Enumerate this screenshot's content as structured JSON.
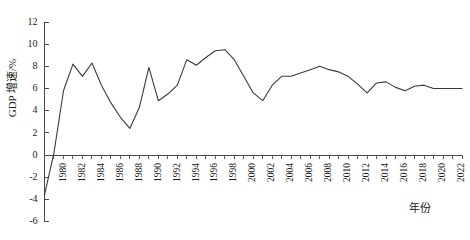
{
  "chart_data": {
    "type": "line",
    "title": "",
    "xlabel": "年份",
    "ylabel": "GDP 增速/%",
    "xlim": [
      1978,
      2022
    ],
    "ylim": [
      -6,
      12
    ],
    "grid": false,
    "legend": null,
    "y_ticks": [
      12,
      10,
      8,
      6,
      4,
      2,
      0,
      -2,
      -4,
      -6
    ],
    "y_tick_labels": [
      "12",
      "10",
      "8",
      "6",
      "4",
      "2",
      "0",
      "-2",
      "-4",
      "-6"
    ],
    "x_ticks": [
      1980,
      1982,
      1984,
      1986,
      1988,
      1990,
      1992,
      1994,
      1996,
      1998,
      2000,
      2002,
      2004,
      2006,
      2008,
      2010,
      2012,
      2014,
      2016,
      2018,
      2020,
      2022
    ],
    "x_tick_labels": [
      "1980",
      "1982",
      "1984",
      "1986",
      "1988",
      "1990",
      "1992",
      "1994",
      "1996",
      "1998",
      "2000",
      "2002",
      "2004",
      "2006",
      "2008",
      "2010",
      "2012",
      "2014",
      "2016",
      "2018",
      "2020",
      "2022"
    ],
    "x": [
      1978,
      1979,
      1980,
      1981,
      1982,
      1983,
      1984,
      1985,
      1986,
      1987,
      1988,
      1989,
      1990,
      1991,
      1992,
      1993,
      1994,
      1995,
      1996,
      1997,
      1998,
      1999,
      2000,
      2001,
      2002,
      2003,
      2004,
      2005,
      2006,
      2007,
      2008,
      2009,
      2010,
      2011,
      2012,
      2013,
      2014,
      2015,
      2016,
      2017,
      2018,
      2019,
      2020,
      2021,
      2022
    ],
    "values": [
      -3.6,
      0.2,
      5.8,
      8.2,
      7.1,
      8.3,
      6.3,
      4.7,
      3.4,
      2.4,
      4.3,
      7.9,
      4.9,
      5.5,
      6.3,
      8.6,
      8.1,
      8.8,
      9.4,
      9.5,
      8.6,
      7.1,
      5.6,
      4.9,
      6.3,
      7.1,
      7.1,
      7.4,
      7.7,
      8.0,
      7.7,
      7.5,
      7.1,
      6.4,
      5.6,
      6.5,
      6.6,
      6.1,
      5.8,
      6.2,
      6.3,
      6.0,
      6.0,
      6.0,
      6.0
    ],
    "series_name": "GDP 增速"
  },
  "axis": {
    "y_title": "GDP 增速/%",
    "x_title": "年份"
  },
  "colors": {
    "line": "#3a3a3a",
    "axis": "#4a4a4a",
    "background": "#ffffff",
    "text": "#1a1a1a"
  }
}
